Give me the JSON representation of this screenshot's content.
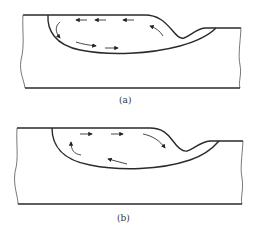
{
  "figure": {
    "panels": [
      {
        "id": "a",
        "label": "(a)",
        "description": "Weld pool cross-section with inward (centripetal) surface flow: surface arrows point left toward the pool edge, return flow along bottom toward the right",
        "flow_direction": "surface flow right-to-left, bottom flow left-to-right"
      },
      {
        "id": "b",
        "label": "(b)",
        "description": "Weld pool cross-section with outward surface flow: surface arrows point right toward the depression, return flow along bottom toward the left",
        "flow_direction": "surface flow left-to-right, bottom flow right-to-left"
      }
    ],
    "colors": {
      "line": "#2a2a2a",
      "background": "#ffffff"
    }
  }
}
